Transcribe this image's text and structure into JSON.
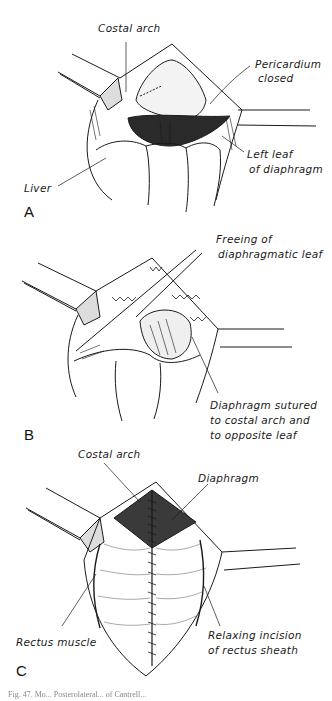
{
  "figure": {
    "panels": [
      {
        "letter": "A",
        "labels": {
          "costal_arch": "Costal arch",
          "pericardium_line1": "Pericardium",
          "pericardium_line2": "closed",
          "left_leaf_line1": "Left leaf",
          "left_leaf_line2": "of diaphragm",
          "liver": "Liver"
        }
      },
      {
        "letter": "B",
        "labels": {
          "freeing_line1": "Freeing of",
          "freeing_line2": "diaphragmatic leaf",
          "sutured_line1": "Diaphragm sutured",
          "sutured_line2": "to costal arch and",
          "sutured_line3": "to opposite leaf"
        }
      },
      {
        "letter": "C",
        "labels": {
          "costal_arch": "Costal arch",
          "diaphragm": "Diaphragm",
          "rectus_muscle": "Rectus muscle",
          "relaxing_line1": "Relaxing incision",
          "relaxing_line2": "of rectus sheath"
        }
      }
    ],
    "caption": "Fig. 47. Mo... Posterolateral... of Cantrell..."
  },
  "colors": {
    "ink": "#1a1a1a",
    "background": "#ffffff",
    "caption": "#888888"
  }
}
